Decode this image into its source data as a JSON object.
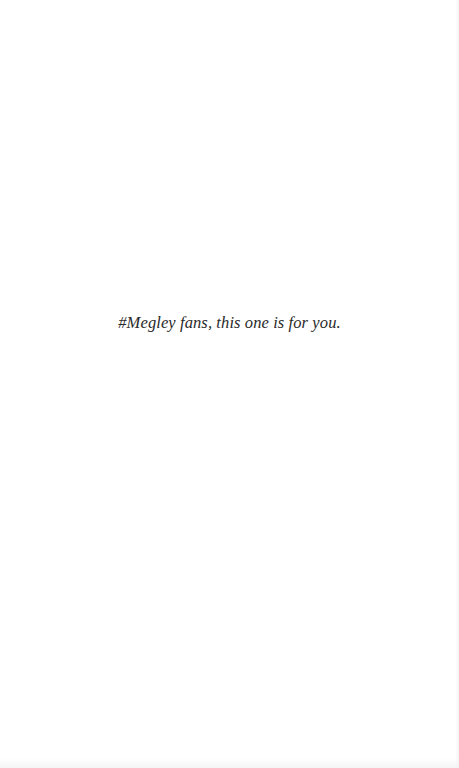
{
  "page": {
    "dedication_text": "#Megley fans, this one is for you.",
    "background_color": "#ffffff",
    "text_color": "#2a2a2a"
  }
}
